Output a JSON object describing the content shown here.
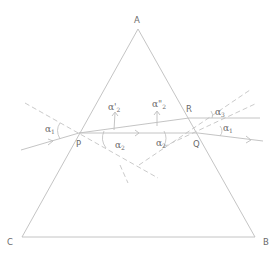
{
  "diagram": {
    "type": "prism-refraction",
    "vertices": [
      {
        "id": "A",
        "label": "A"
      },
      {
        "id": "B",
        "label": "B"
      },
      {
        "id": "C",
        "label": "C"
      }
    ],
    "points": [
      {
        "id": "P",
        "label": "P"
      },
      {
        "id": "Q",
        "label": "Q"
      },
      {
        "id": "R",
        "label": "R"
      }
    ],
    "angles": {
      "alpha1_left": {
        "symbol": "α",
        "sub": "1"
      },
      "alpha2_prime": {
        "symbol": "α'",
        "sub": "2"
      },
      "alpha2_double_prime": {
        "symbol": "α\"",
        "sub": "2"
      },
      "alpha2_left": {
        "symbol": "α",
        "sub": "2"
      },
      "alpha2_right": {
        "symbol": "α",
        "sub": "2"
      },
      "alpha3": {
        "symbol": "α",
        "sub": "3"
      },
      "alpha1_right": {
        "symbol": "α",
        "sub": "1"
      }
    },
    "colors": {
      "lines": "#bdbdbd",
      "dashed": "#c4c4c4",
      "text": "#6a6a6a"
    }
  }
}
